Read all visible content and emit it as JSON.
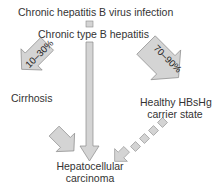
{
  "diagram": {
    "nodes": {
      "infection": "Chronic hepatitis B virus infection",
      "hepatitis": "Chronic type B hepatitis",
      "cirrhosis": "Cirrhosis",
      "carrier_line1": "Healthy HBsHg",
      "carrier_line2": "carrier state",
      "hcc_line1": "Hepatocellular",
      "hcc_line2": "carcinoma"
    },
    "edges": {
      "to_hepatitis_pct": "10–30%",
      "to_carrier_pct": "70–90%"
    },
    "colors": {
      "arrow_fill": "#d4d4d4",
      "arrow_stroke": "#8a8a8a",
      "text": "#333333"
    }
  }
}
